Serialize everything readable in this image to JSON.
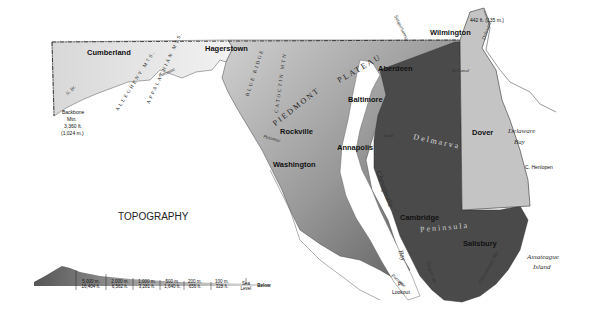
{
  "title": "TOPOGRAPHY",
  "cities": {
    "cumberland": "Cumberland",
    "hagerstown": "Hagerstown",
    "wilmington": "Wilmington",
    "aberdeen": "Aberdeen",
    "baltimore": "Baltimore",
    "rockville": "Rockville",
    "annapolis": "Annapolis",
    "washington": "Washington",
    "dover": "Dover",
    "cambridge": "Cambridge",
    "salisbury": "Salisbury"
  },
  "regions": {
    "allegheny": "ALLEGHENY MTS.",
    "appalachian": "APPALACHIAN MTS.",
    "blue_ridge": "BLUE RIDGE",
    "catoctin": "CATOCTIN MTN",
    "piedmont": "PIEDMONT",
    "plateau": "PLATEAU",
    "delmarva": "Delmarva",
    "peninsula": "Peninsula"
  },
  "water": {
    "potomac": "Potomac",
    "susquehanna": "Susquehanna",
    "delaware_r": "Delaware",
    "delaware_bay_1": "Delaware",
    "delaware_bay_2": "Bay",
    "chesapeake": "Chesapeake",
    "bay": "Bay",
    "kent": "Kent",
    "tangier": "Tangier Sd.",
    "chincoteague": "Chincoteague Bay",
    "dc_canal": "D.Canal",
    "n_br": "N. Br."
  },
  "points": {
    "backbone_1": "Backbone",
    "backbone_2": "Mtn.",
    "backbone_3": "3,360 ft.",
    "backbone_4": "(1,024 m.)",
    "high_de": "442 ft. (135 m.)",
    "c_henlopen": "C. Henlopen",
    "pt_lookout_1": "Pt.",
    "pt_lookout_2": "Lookout",
    "assateague_1": "Assateague",
    "assateague_2": "Island"
  },
  "legend": [
    {
      "m": "5,000 m.",
      "ft": "16,404 ft."
    },
    {
      "m": "2,000 m.",
      "ft": "6,562 ft."
    },
    {
      "m": "1,000 m.",
      "ft": "3,281 ft."
    },
    {
      "m": "500 m.",
      "ft": "1,640 ft."
    },
    {
      "m": "200 m.",
      "ft": "656 ft."
    },
    {
      "m": "100 m.",
      "ft": "328 ft."
    },
    {
      "m": "Sea",
      "ft": "Level"
    }
  ],
  "legend_below": "Below"
}
